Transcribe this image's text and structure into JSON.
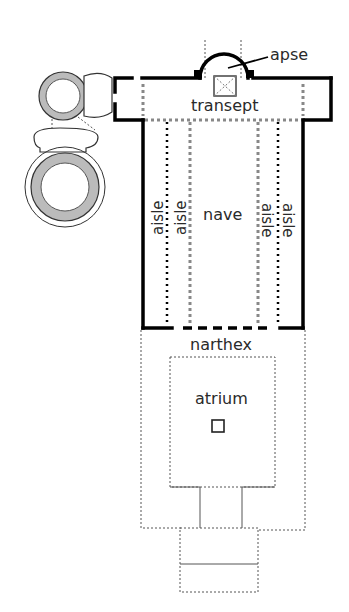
{
  "diagram": {
    "type": "architectural-floor-plan",
    "labels": {
      "apse": "apse",
      "transept": "transept",
      "nave": "nave",
      "aisle_1": "aisle",
      "aisle_2": "aisle",
      "aisle_3": "aisle",
      "aisle_4": "aisle",
      "narthex": "narthex",
      "atrium": "atrium"
    },
    "colors": {
      "walls": "#000000",
      "text": "#2a2a2a",
      "hatch": "#bbbbbb",
      "background": "#ffffff"
    }
  }
}
